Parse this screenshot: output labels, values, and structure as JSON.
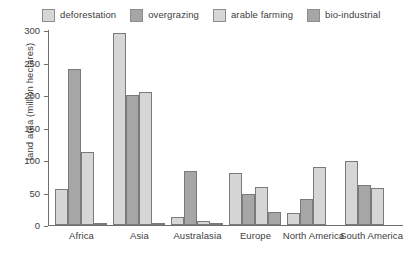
{
  "chart_data": {
    "type": "bar",
    "title": "",
    "xlabel": "",
    "ylabel": "land area (million hectares)",
    "ylim": [
      0,
      300
    ],
    "yticks": [
      0,
      50,
      100,
      150,
      200,
      250,
      300
    ],
    "ytick_labels": [
      "0",
      "50",
      "100",
      "150",
      "200",
      "250",
      "300"
    ],
    "grid": false,
    "legend_position": "top",
    "categories": [
      "Africa",
      "Asia",
      "Australasia",
      "Europe",
      "North America",
      "South America"
    ],
    "series": [
      {
        "name": "deforestation",
        "color": "#d6d6d6",
        "values": [
          55,
          295,
          12,
          80,
          18,
          99
        ]
      },
      {
        "name": "overgrazing",
        "color": "#a6a6a6",
        "values": [
          240,
          200,
          83,
          47,
          40,
          62
        ]
      },
      {
        "name": "arable farming",
        "color": "#d6d6d6",
        "values": [
          112,
          205,
          6,
          58,
          89,
          57
        ]
      },
      {
        "name": "bio-industrial",
        "color": "#a6a6a6",
        "values": [
          3,
          2,
          1,
          20,
          0,
          0
        ]
      }
    ]
  },
  "legend": {
    "items": [
      {
        "label": "deforestation",
        "color": "#d6d6d6"
      },
      {
        "label": "overgrazing",
        "color": "#a6a6a6"
      },
      {
        "label": "arable farming",
        "color": "#d6d6d6"
      },
      {
        "label": "bio-industrial",
        "color": "#a6a6a6"
      }
    ]
  },
  "axis": {
    "y_title": "land area (million hectares)"
  }
}
